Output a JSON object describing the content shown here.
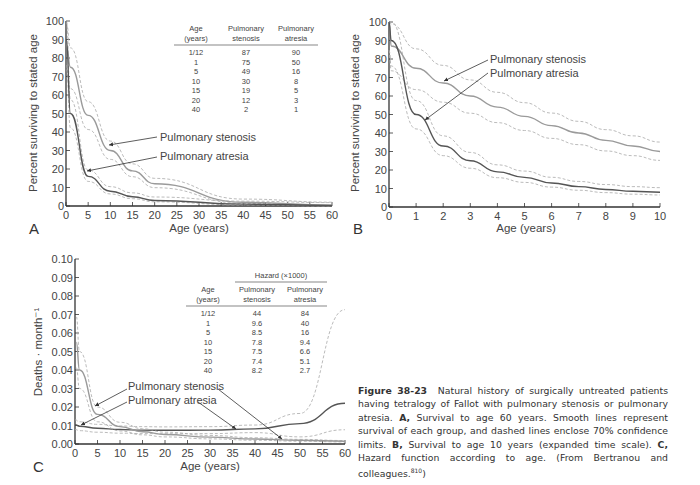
{
  "figure": {
    "caption": {
      "label": "Figure 38-23",
      "text_intro": "Natural history of surgically untreated patients having tetralogy of Fallot with pulmonary stenosis or pulmonary atresia.",
      "a_label": "A,",
      "a_text": "Survival to age 60 years. Smooth lines represent survival of each group, and dashed lines enclose 70% confidence limits.",
      "b_label": "B,",
      "b_text": "Survival to age 10 years (expanded time scale).",
      "c_label": "C,",
      "c_text": "Hazard function according to age. (From Bertranou and colleagues.",
      "ref": "810",
      "close": ")"
    }
  },
  "panels": {
    "a": {
      "letter": "A",
      "xlabel": "Age (years)",
      "ylabel": "Percent surviving to stated age",
      "label_stenosis": "Pulmonary stenosis",
      "label_atresia": "Pulmonary atresia",
      "table": {
        "headers": [
          [
            "Age",
            "(years)"
          ],
          [
            "Pulmonary",
            "stenosis"
          ],
          [
            "Pulmonary",
            "atresia"
          ]
        ],
        "rows": [
          [
            "1/12",
            "87",
            "90"
          ],
          [
            "1",
            "75",
            "50"
          ],
          [
            "5",
            "49",
            "16"
          ],
          [
            "10",
            "30",
            "8"
          ],
          [
            "15",
            "19",
            "5"
          ],
          [
            "20",
            "12",
            "3"
          ],
          [
            "40",
            "2",
            "1"
          ]
        ]
      }
    },
    "b": {
      "letter": "B",
      "xlabel": "Age (years)",
      "ylabel": "Percent surviving to stated age",
      "label_stenosis": "Pulmonary stenosis",
      "label_atresia": "Pulmonary atresia"
    },
    "c": {
      "letter": "C",
      "xlabel": "Age (years)",
      "ylabel": "Deaths · month⁻¹",
      "label_stenosis": "Pulmonary stenosis",
      "label_atresia": "Pulmonary atresia",
      "table": {
        "group_header": "Hazard (×1000)",
        "headers": [
          [
            "Age",
            "(years)"
          ],
          [
            "Pulmonary",
            "stenosis"
          ],
          [
            "Pulmonary",
            "atresia"
          ]
        ],
        "rows": [
          [
            "1/12",
            "44",
            "84"
          ],
          [
            "1",
            "9.6",
            "40"
          ],
          [
            "5",
            "8.5",
            "16"
          ],
          [
            "10",
            "7.8",
            "9.4"
          ],
          [
            "15",
            "7.5",
            "6.6"
          ],
          [
            "20",
            "7.4",
            "5.1"
          ],
          [
            "40",
            "8.2",
            "2.7"
          ]
        ]
      }
    }
  },
  "chart_data": [
    {
      "panel": "A",
      "type": "line",
      "title": "",
      "xlabel": "Age (years)",
      "ylabel": "Percent surviving to stated age",
      "xlim": [
        0,
        60
      ],
      "ylim": [
        0,
        100
      ],
      "xticks": [
        0,
        5,
        10,
        15,
        20,
        25,
        30,
        35,
        40,
        45,
        50,
        55,
        60
      ],
      "yticks": [
        0,
        10,
        20,
        30,
        40,
        50,
        60,
        70,
        80,
        90,
        100
      ],
      "grid": false,
      "series": [
        {
          "name": "Pulmonary stenosis",
          "style": "solid light gray with dashed 70% CL",
          "x": [
            0.083,
            1,
            5,
            10,
            15,
            20,
            40,
            60
          ],
          "y": [
            87,
            75,
            49,
            30,
            19,
            12,
            2,
            0.5
          ]
        },
        {
          "name": "Pulmonary atresia",
          "style": "solid dark gray with dashed 70% CL",
          "x": [
            0.083,
            1,
            5,
            10,
            15,
            20,
            40,
            60
          ],
          "y": [
            90,
            50,
            16,
            8,
            5,
            3,
            1,
            0.3
          ]
        }
      ]
    },
    {
      "panel": "B",
      "type": "line",
      "title": "",
      "xlabel": "Age (years)",
      "ylabel": "Percent surviving to stated age",
      "xlim": [
        0,
        10
      ],
      "ylim": [
        0,
        100
      ],
      "xticks": [
        0,
        1,
        2,
        3,
        4,
        5,
        6,
        7,
        8,
        9,
        10
      ],
      "yticks": [
        0,
        10,
        20,
        30,
        40,
        50,
        60,
        70,
        80,
        90,
        100
      ],
      "grid": false,
      "series": [
        {
          "name": "Pulmonary stenosis",
          "x": [
            0,
            0.083,
            1,
            2,
            3,
            4,
            5,
            6,
            7,
            8,
            9,
            10
          ],
          "y": [
            100,
            87,
            75,
            67,
            60,
            54,
            49,
            44,
            40,
            36,
            33,
            30
          ]
        },
        {
          "name": "Pulmonary atresia",
          "x": [
            0,
            0.083,
            1,
            2,
            3,
            4,
            5,
            6,
            7,
            8,
            9,
            10
          ],
          "y": [
            100,
            90,
            50,
            33,
            25,
            19,
            16,
            13,
            11,
            9.5,
            8.5,
            8
          ]
        }
      ]
    },
    {
      "panel": "C",
      "type": "line",
      "title": "",
      "xlabel": "Age (years)",
      "ylabel": "Deaths · month⁻¹",
      "xlim": [
        0,
        60
      ],
      "ylim": [
        0,
        0.1
      ],
      "xticks": [
        0,
        5,
        10,
        15,
        20,
        25,
        30,
        35,
        40,
        45,
        50,
        55,
        60
      ],
      "yticks": [
        0.0,
        0.01,
        0.02,
        0.03,
        0.04,
        0.05,
        0.06,
        0.07,
        0.08,
        0.09,
        0.1
      ],
      "grid": false,
      "series": [
        {
          "name": "Pulmonary stenosis",
          "x": [
            0,
            1,
            5,
            10,
            15,
            20,
            30,
            40,
            50,
            60
          ],
          "y": [
            0.0105,
            0.0096,
            0.0085,
            0.0078,
            0.0075,
            0.0074,
            0.0075,
            0.0082,
            0.011,
            0.022
          ]
        },
        {
          "name": "Pulmonary atresia",
          "x": [
            0.3,
            1,
            5,
            10,
            15,
            20,
            30,
            40,
            50,
            60
          ],
          "y": [
            0.055,
            0.04,
            0.016,
            0.0094,
            0.0066,
            0.0051,
            0.0037,
            0.0027,
            0.002,
            0.0015
          ]
        }
      ]
    }
  ]
}
